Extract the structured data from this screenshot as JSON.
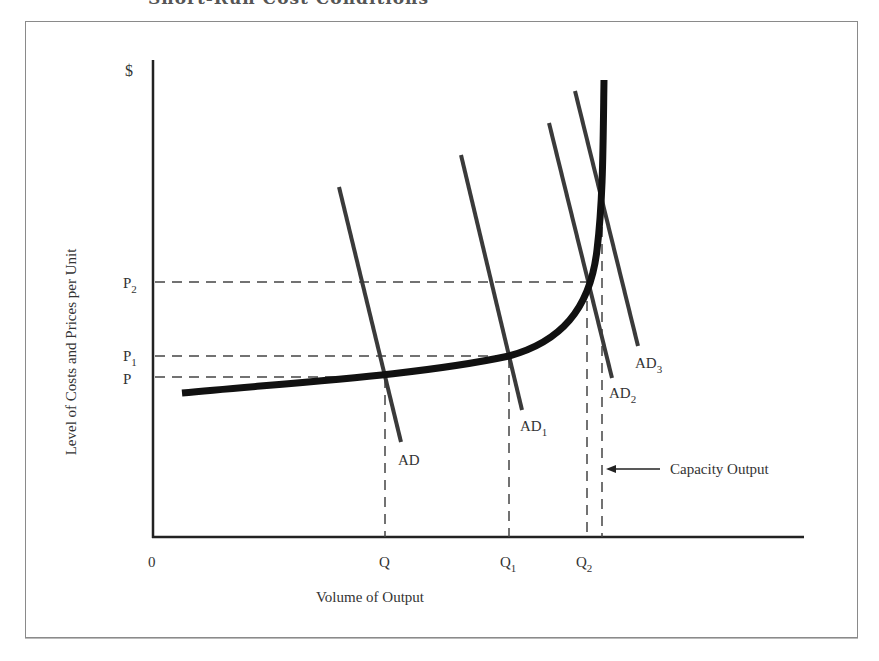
{
  "figure": {
    "clipped_title": "Short-Run Cost Conditions",
    "y_axis_unit": "$",
    "y_axis_label": "Level of Costs and Prices per Unit",
    "x_axis_label": "Volume of Output",
    "origin_label": "0",
    "price_ticks": [
      {
        "base": "P",
        "sub": "2"
      },
      {
        "base": "P",
        "sub": "1"
      },
      {
        "base": "P",
        "sub": ""
      }
    ],
    "quantity_ticks": [
      {
        "base": "Q",
        "sub": ""
      },
      {
        "base": "Q",
        "sub": "1"
      },
      {
        "base": "Q",
        "sub": "2"
      }
    ],
    "demand_curves": [
      {
        "base": "AD",
        "sub": ""
      },
      {
        "base": "AD",
        "sub": "1"
      },
      {
        "base": "AD",
        "sub": "2"
      },
      {
        "base": "AD",
        "sub": "3"
      }
    ],
    "annotation": "Capacity Output"
  },
  "colors": {
    "curve": "#111111",
    "ad_lines": "#3a3a3a",
    "dashes": "#444444",
    "frame": "#8a8a8a"
  }
}
